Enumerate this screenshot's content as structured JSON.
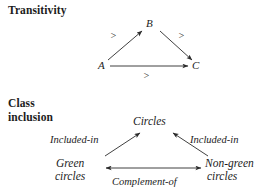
{
  "figure": {
    "type": "diagram",
    "background_color": "#ffffff",
    "ink_color": "#1c1c1c"
  },
  "panels": [
    {
      "id": "transitivity",
      "heading": "Transitivity",
      "nodes": [
        {
          "id": "A",
          "label": "A",
          "x": 102,
          "y": 66
        },
        {
          "id": "B",
          "label": "B",
          "x": 150,
          "y": 24
        },
        {
          "id": "C",
          "label": "C",
          "x": 197,
          "y": 66
        }
      ],
      "edges": [
        {
          "from": "A",
          "to": "B",
          "label": ">",
          "label_x": 114,
          "label_y": 36
        },
        {
          "from": "B",
          "to": "C",
          "label": ">",
          "label_x": 182,
          "label_y": 36
        },
        {
          "from": "A",
          "to": "C",
          "label": ">",
          "label_x": 147,
          "label_y": 76
        }
      ]
    },
    {
      "id": "class-inclusion",
      "heading_line1": "Class",
      "heading_line2": "inclusion",
      "nodes": [
        {
          "id": "circles",
          "label": "Circles",
          "x": 156,
          "y": 123
        },
        {
          "id": "green",
          "label_line1": "Green",
          "label_line2": "circles",
          "x": 82,
          "y": 171
        },
        {
          "id": "nongreen",
          "label_line1": "Non-green",
          "label_line2": "circles",
          "x": 238,
          "y": 171
        }
      ],
      "edges": [
        {
          "from": "green",
          "to": "circles",
          "label": "Included-in",
          "label_x": 82,
          "label_y": 141
        },
        {
          "from": "nongreen",
          "to": "circles",
          "label": "Included-in",
          "label_x": 222,
          "label_y": 141
        },
        {
          "from": "green",
          "to": "nongreen",
          "label": "Complement-of",
          "label_x": 150,
          "label_y": 183,
          "bidirectional": true
        }
      ]
    }
  ]
}
